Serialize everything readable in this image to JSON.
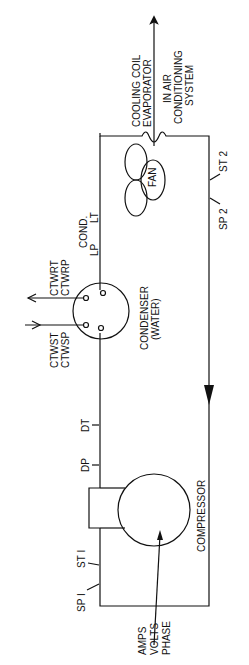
{
  "diagram": {
    "components": {
      "evaporator": {
        "line1": "COOLING COIL",
        "line2": "EVAPORATOR",
        "line3": "IN  AIR",
        "line4": "CONDITIONING",
        "line5": "SYSTEM"
      },
      "fan": {
        "label": "FAN"
      },
      "condenser": {
        "line1": "CONDENSER",
        "line2": "(WATER)"
      },
      "compressor": {
        "label": "COMPRESSOR"
      }
    },
    "labels": {
      "ctwrt": "CTWRT",
      "ctwrp": "CTWRP",
      "ctwst": "CTWST",
      "ctwsp": "CTWSP",
      "cond": "COND.",
      "lp": "LP",
      "lt": "LT",
      "dt": "DT",
      "dp": "DP",
      "st1": "ST I",
      "sp1": "SP I",
      "st2": "ST 2",
      "sp2": "SP 2",
      "amps": "AMPS",
      "volts": "VOLTS",
      "phase": "PHASE"
    }
  }
}
